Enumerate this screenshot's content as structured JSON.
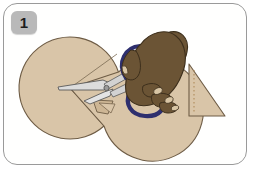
{
  "illustration": {
    "title": "Step 1 - Cutting a wedge from a paper circle with scissors",
    "step_number": "1",
    "frame": {
      "border_color": "#9a9a9a",
      "background": "#ffffff",
      "corner_radius": "14px"
    },
    "badge": {
      "label": "1",
      "background": "#b9b9b9",
      "text_color": "#1c1c1c"
    },
    "objects": [
      {
        "name": "paper-circle",
        "description": "Large tan paper disc with a wedge being cut out",
        "fill": "#d9c5a8",
        "outline": "#6e5c45",
        "center_x": 70,
        "center_y": 88,
        "radius": 51
      },
      {
        "name": "cut-line",
        "description": "Thin scored line from circle center toward upper right edge",
        "color": "#7a6a52"
      },
      {
        "name": "cut-wedge",
        "description": "Small wedge piece separating from the circle near the blades",
        "fill": "#cdb695",
        "outline": "#6e5c45"
      },
      {
        "name": "scissors",
        "description": "Scissors with silver blades pointing left and dark blue handle loops",
        "blade_fill": "#dcdcdc",
        "blade_outline": "#5a5a5a",
        "handle_color": "#2e2f6e",
        "pivot_color": "#8a8a8a"
      },
      {
        "name": "hand",
        "description": "Dark brown right hand gripping the scissors handles",
        "skin_fill": "#6b5435",
        "skin_outline": "#3d2f1c",
        "nail_fill": "#d8c5a4"
      },
      {
        "name": "result-triangle",
        "description": "Right triangle of tan paper with a dotted fold line near its vertical edge",
        "fill": "#d9c5a8",
        "outline": "#6e5c45",
        "dotted_line_color": "#b08a5a"
      }
    ]
  }
}
